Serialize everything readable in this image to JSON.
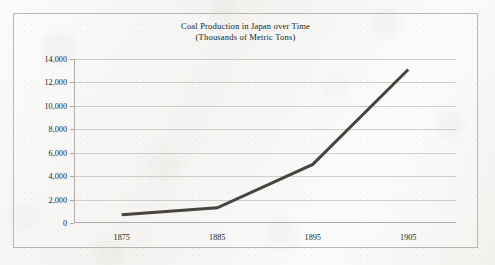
{
  "chart_data": {
    "type": "line",
    "title": "Coal Production in Japan over Time",
    "subtitle": "(Thousands of Metric Tons)",
    "xlabel": "",
    "ylabel": "",
    "x": [
      1875,
      1885,
      1895,
      1905
    ],
    "categories": [
      "1875",
      "1885",
      "1895",
      "1905"
    ],
    "values": [
      700,
      1300,
      5000,
      13100
    ],
    "series": [
      {
        "name": "Coal Production",
        "values": [
          700,
          1300,
          5000,
          13100
        ]
      }
    ],
    "xlim": [
      1870,
      1910
    ],
    "ylim": [
      0,
      14000
    ],
    "ytick_values": [
      0,
      2000,
      4000,
      6000,
      8000,
      10000,
      12000,
      14000
    ],
    "ytick_labels": [
      "0",
      "2,000",
      "4,000",
      "6,000",
      "8,000",
      "10,000",
      "12,000",
      "14,000"
    ],
    "xtick_values": [
      1875,
      1885,
      1895,
      1905
    ],
    "xtick_labels": [
      "1875",
      "1885",
      "1895",
      "1905"
    ],
    "grid": "horizontal",
    "legend": "none",
    "line_color": "#474441",
    "line_width": 3,
    "grid_color": "#cfcdca",
    "axis_color": "#b0aeab",
    "text_color": "#221f1d",
    "background_color": "#f7f6f4",
    "border_color": "#b9b7b4"
  }
}
